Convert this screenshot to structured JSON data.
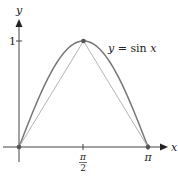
{
  "chart_data": {
    "type": "line",
    "title": "",
    "xlabel": "x",
    "ylabel": "y",
    "xlim": [
      0,
      3.14159
    ],
    "ylim": [
      0,
      1
    ],
    "grid": false,
    "series": [
      {
        "name": "y = sin x",
        "function": "sin",
        "x_range": [
          0,
          3.14159
        ],
        "color": "#777777"
      },
      {
        "name": "chord-left",
        "x": [
          0,
          1.5708
        ],
        "y": [
          0,
          1
        ],
        "color": "#aaaaaa"
      },
      {
        "name": "chord-right",
        "x": [
          1.5708,
          3.14159
        ],
        "y": [
          1,
          0
        ],
        "color": "#aaaaaa"
      }
    ],
    "points": [
      {
        "x": 0,
        "y": 0
      },
      {
        "x": 1.5708,
        "y": 1
      },
      {
        "x": 3.14159,
        "y": 0
      }
    ],
    "x_ticks": [
      {
        "value": 1.5708,
        "label_num": "π",
        "label_den": "2"
      },
      {
        "value": 3.14159,
        "label": "π"
      }
    ],
    "y_ticks": [
      {
        "value": 1,
        "label": "1"
      }
    ],
    "annotations": [
      {
        "text": "y = sin x",
        "x": 2.2,
        "y": 0.95
      }
    ],
    "colors": {
      "axis": "#444444",
      "curve": "#777777",
      "chord": "#aaaaaa",
      "point": "#555555"
    }
  }
}
